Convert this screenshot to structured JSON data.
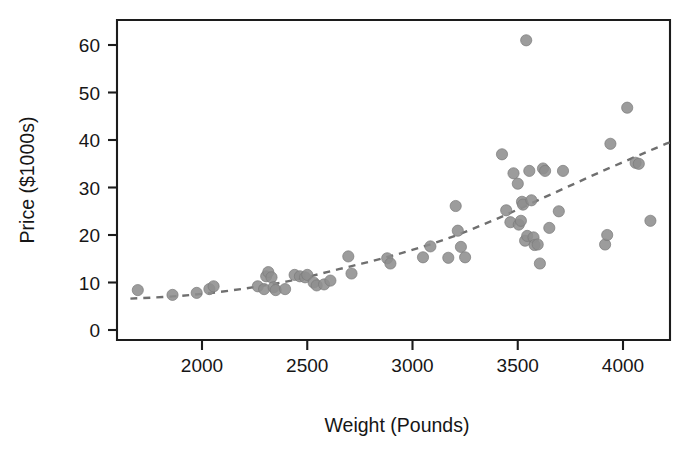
{
  "figure": {
    "width": 699,
    "height": 461,
    "background": "#ffffff",
    "marker_color": "#8e8e8e",
    "trendline_color": "#6f6f6f",
    "axis_color": "#1c1c1c"
  },
  "axes": {
    "x_title": "Weight (Pounds)",
    "y_title": "Price ($1000s)",
    "x_ticks": [
      "2000",
      "2500",
      "3000",
      "3500",
      "4000"
    ],
    "y_ticks": [
      "0",
      "10",
      "20",
      "30",
      "40",
      "50",
      "60"
    ]
  },
  "chart_data": {
    "type": "scatter",
    "title": "",
    "xlabel": "Weight (Pounds)",
    "ylabel": "Price ($1000s)",
    "xlim": [
      1620,
      4230
    ],
    "ylim": [
      -2,
      65
    ],
    "xticks": [
      2000,
      2500,
      3000,
      3500,
      4000
    ],
    "yticks": [
      0,
      10,
      20,
      30,
      40,
      50,
      60
    ],
    "grid": false,
    "legend": null,
    "series": [
      {
        "name": "Cars",
        "marker": "circle",
        "color": "#8e8e8e",
        "points": [
          [
            1695,
            8.4
          ],
          [
            1860,
            7.4
          ],
          [
            1975,
            7.8
          ],
          [
            2035,
            8.6
          ],
          [
            2055,
            9.2
          ],
          [
            2265,
            9.2
          ],
          [
            2295,
            8.6
          ],
          [
            2305,
            11.3
          ],
          [
            2315,
            12.2
          ],
          [
            2330,
            11.1
          ],
          [
            2340,
            9.0
          ],
          [
            2350,
            8.4
          ],
          [
            2395,
            8.6
          ],
          [
            2440,
            11.6
          ],
          [
            2465,
            11.3
          ],
          [
            2490,
            11.1
          ],
          [
            2500,
            11.6
          ],
          [
            2530,
            10.0
          ],
          [
            2545,
            9.4
          ],
          [
            2580,
            9.6
          ],
          [
            2610,
            10.4
          ],
          [
            2695,
            15.5
          ],
          [
            2710,
            11.9
          ],
          [
            2880,
            15.1
          ],
          [
            2895,
            14.0
          ],
          [
            3050,
            15.3
          ],
          [
            3085,
            17.6
          ],
          [
            3170,
            15.2
          ],
          [
            3205,
            26.1
          ],
          [
            3215,
            20.9
          ],
          [
            3230,
            17.5
          ],
          [
            3250,
            15.3
          ],
          [
            3425,
            37.0
          ],
          [
            3445,
            25.2
          ],
          [
            3465,
            22.7
          ],
          [
            3480,
            33.0
          ],
          [
            3500,
            30.8
          ],
          [
            3505,
            22.2
          ],
          [
            3515,
            23.0
          ],
          [
            3520,
            27.0
          ],
          [
            3525,
            26.4
          ],
          [
            3535,
            18.8
          ],
          [
            3540,
            61.0
          ],
          [
            3545,
            19.8
          ],
          [
            3555,
            33.5
          ],
          [
            3565,
            27.3
          ],
          [
            3575,
            19.5
          ],
          [
            3580,
            17.9
          ],
          [
            3595,
            18.0
          ],
          [
            3605,
            14.0
          ],
          [
            3620,
            34.0
          ],
          [
            3630,
            33.5
          ],
          [
            3650,
            21.5
          ],
          [
            3695,
            25.0
          ],
          [
            3715,
            33.5
          ],
          [
            3915,
            18.0
          ],
          [
            3925,
            20.0
          ],
          [
            3940,
            39.2
          ],
          [
            4020,
            46.8
          ],
          [
            4060,
            35.2
          ],
          [
            4075,
            35.0
          ],
          [
            4130,
            23.0
          ]
        ]
      }
    ],
    "trendline": {
      "name": "fitted curve",
      "style": "dashed",
      "color": "#6f6f6f",
      "points": [
        [
          1660,
          6.6
        ],
        [
          1900,
          7.2
        ],
        [
          2150,
          8.4
        ],
        [
          2400,
          10.2
        ],
        [
          2650,
          12.8
        ],
        [
          2900,
          15.6
        ],
        [
          3150,
          19.0
        ],
        [
          3400,
          23.4
        ],
        [
          3650,
          28.4
        ],
        [
          3900,
          33.4
        ],
        [
          4150,
          38.2
        ],
        [
          4230,
          39.6
        ]
      ]
    }
  }
}
